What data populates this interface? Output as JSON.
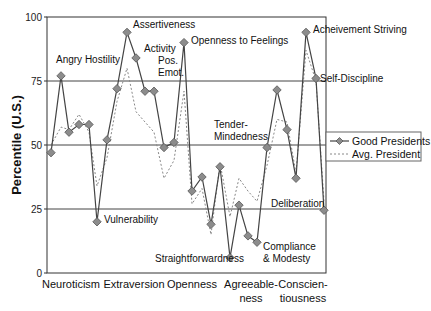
{
  "chart_data": {
    "type": "line",
    "title": "",
    "xlabel": "",
    "ylabel": "Percentile (U.S.)",
    "ylim": [
      0,
      100
    ],
    "yticks": [
      0,
      25,
      50,
      75,
      100
    ],
    "grid": "horizontal",
    "legend_position": "right",
    "domains": [
      "Neuroticism",
      "Extraversion",
      "Openness",
      "Agreeable-\nness",
      "Conscien-\ntiousness"
    ],
    "x": [
      "N1",
      "N2",
      "N3",
      "N4",
      "N5",
      "N6",
      "E1",
      "E2",
      "E3",
      "E4",
      "E5",
      "E6",
      "O1",
      "O2",
      "O3",
      "O4",
      "O5",
      "O6",
      "A1",
      "A2",
      "A3",
      "A4",
      "A5",
      "A6",
      "C1",
      "C2",
      "C3",
      "C4",
      "C5",
      "C6"
    ],
    "series": [
      {
        "name": "Good Presidents",
        "style": "solid-diamond",
        "color": "#444444",
        "marker_color": "#8c8c8c",
        "values": [
          47,
          77,
          55,
          58,
          58,
          20,
          52,
          72,
          94,
          84,
          71,
          71,
          49,
          51,
          90,
          32,
          37.5,
          19,
          41.5,
          6,
          26.5,
          14.5,
          12,
          49,
          71.5,
          56,
          37,
          94,
          76,
          24.5
        ]
      },
      {
        "name": "Avg. President",
        "style": "dotted",
        "color": "#888888",
        "values": [
          50,
          57,
          56,
          62,
          55,
          34,
          45,
          67,
          80,
          63,
          59,
          55,
          37,
          44,
          71,
          27,
          33,
          15,
          43,
          22,
          37,
          32,
          28,
          42,
          60,
          59,
          39,
          87,
          75,
          28
        ]
      }
    ],
    "annotations": [
      {
        "text": "Angry Hostility",
        "point": 1
      },
      {
        "text": "Vulnerability",
        "point": 5
      },
      {
        "text": "Assertiveness",
        "point": 8
      },
      {
        "text": "Activity",
        "point": 9
      },
      {
        "text": "Pos.\nEmot.",
        "point": 11
      },
      {
        "text": "Openness to Feelings",
        "point": 14
      },
      {
        "text": "Straightforwardness",
        "point": 19
      },
      {
        "text": "Compliance\n& Modesty",
        "point": 21
      },
      {
        "text": "Tender-\nMindedness",
        "point": 23
      },
      {
        "text": "Acheivement Striving",
        "point": 27
      },
      {
        "text": "Self-Discipline",
        "point": 28
      },
      {
        "text": "Deliberation",
        "point": 29
      }
    ]
  },
  "labels": {
    "ylabel": "Percentile (U.S.)",
    "yticks": [
      "0",
      "25",
      "50",
      "75",
      "100"
    ],
    "domains": {
      "neuroticism": "Neuroticism",
      "extraversion": "Extraversion",
      "openness": "Openness",
      "agree_1": "Agreeable-",
      "agree_2": "ness",
      "consc_1": "Conscien-",
      "consc_2": "tiousness"
    },
    "annotations": {
      "angry": "Angry Hostility",
      "vulnerability": "Vulnerability",
      "assertiveness": "Assertiveness",
      "activity": "Activity",
      "pos_1": "Pos.",
      "pos_2": "Emot.",
      "feelings": "Openness to Feelings",
      "straight": "Straightforwardness",
      "comp_1": "Compliance",
      "comp_2": "& Modesty",
      "tender_1": "Tender-",
      "tender_2": "Mindedness",
      "achieve": "Acheivement Striving",
      "selfdisc": "Self-Discipline",
      "deliberation": "Deliberation"
    },
    "legend": {
      "good": "Good Presidents",
      "avg": "Avg. President"
    }
  }
}
